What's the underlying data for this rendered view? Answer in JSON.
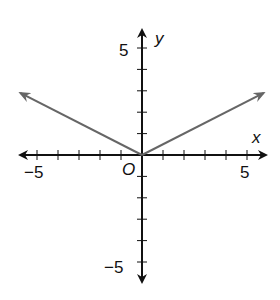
{
  "chart_data": {
    "type": "line",
    "title": "",
    "xlabel": "x",
    "ylabel": "y",
    "xlim": [
      -5.9,
      5.9
    ],
    "ylim": [
      -5.9,
      5.9
    ],
    "x_tick_labels": [
      "-5",
      "5"
    ],
    "y_tick_labels": [
      "5",
      "-5"
    ],
    "origin_label": "O",
    "grid": false,
    "series": [
      {
        "name": "y = 0.5|x|",
        "x": [
          -5.8,
          0,
          5.8
        ],
        "y": [
          2.9,
          0,
          2.9
        ],
        "color": "#666666"
      }
    ]
  },
  "labels": {
    "x_axis": "x",
    "y_axis": "y",
    "origin": "O",
    "x_min": "−5",
    "x_max": "5",
    "y_max": "5",
    "y_min": "−5"
  }
}
